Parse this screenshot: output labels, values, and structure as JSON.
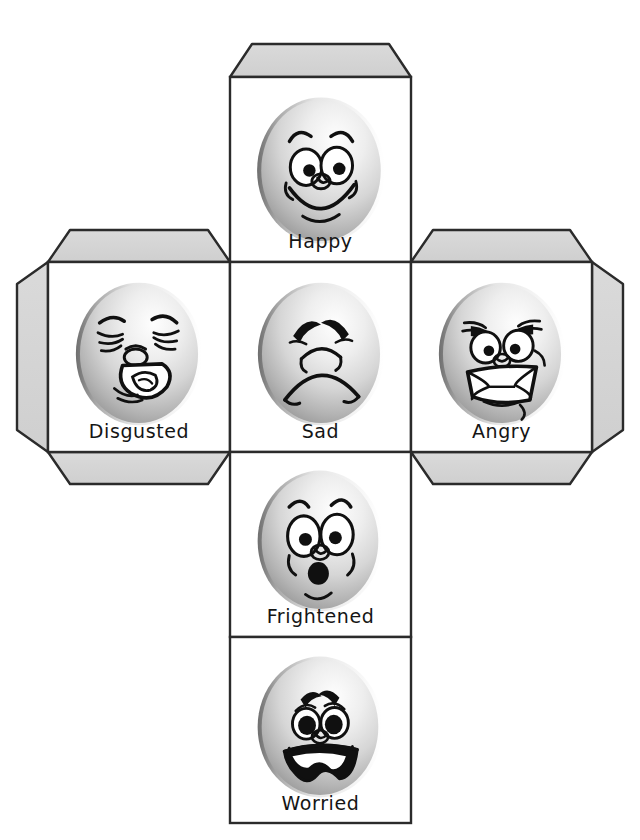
{
  "document": {
    "title": "Emotions Cube Net",
    "description": "Printable foldable cube net (cross layout) with six cartoon emotion faces",
    "page_width": 640,
    "page_height": 840,
    "background_color": "#ffffff"
  },
  "style": {
    "flap_fill": "#d4d4d4",
    "flap_stroke": "#2b2b2b",
    "panel_fill": "#ffffff",
    "panel_stroke": "#2b2b2b",
    "label_color": "#151515",
    "ball_light": "#fdfdfd",
    "ball_mid": "#d2d2d2",
    "ball_dark": "#8e8e8e",
    "ink": "#101010"
  },
  "geometry": {
    "cell": 181,
    "col_x": [
      48,
      230,
      411,
      592
    ],
    "row_y": [
      77,
      262,
      452,
      637,
      823
    ],
    "flap_depth": 33,
    "flap_inset": 22
  },
  "net": {
    "layout": "cross",
    "panels": [
      {
        "id": "panel-happy",
        "label": "Happy",
        "face": "happy",
        "grid": {
          "col": 1,
          "row": 0
        },
        "x": 230,
        "y": 77,
        "w": 181,
        "h": 185,
        "flaps": [
          "top"
        ]
      },
      {
        "id": "panel-disgusted",
        "label": "Disgusted",
        "face": "disgusted",
        "grid": {
          "col": 0,
          "row": 1
        },
        "x": 48,
        "y": 262,
        "w": 182,
        "h": 190,
        "flaps": [
          "left",
          "top",
          "bottom"
        ]
      },
      {
        "id": "panel-sad",
        "label": "Sad",
        "face": "sad",
        "grid": {
          "col": 1,
          "row": 1
        },
        "x": 230,
        "y": 262,
        "w": 181,
        "h": 190,
        "flaps": []
      },
      {
        "id": "panel-angry",
        "label": "Angry",
        "face": "angry",
        "grid": {
          "col": 2,
          "row": 1
        },
        "x": 411,
        "y": 262,
        "w": 181,
        "h": 190,
        "flaps": [
          "right",
          "top",
          "bottom"
        ]
      },
      {
        "id": "panel-frightened",
        "label": "Frightened",
        "face": "frightened",
        "grid": {
          "col": 1,
          "row": 2
        },
        "x": 230,
        "y": 452,
        "w": 181,
        "h": 185,
        "flaps": []
      },
      {
        "id": "panel-worried",
        "label": "Worried",
        "face": "worried",
        "grid": {
          "col": 1,
          "row": 3
        },
        "x": 230,
        "y": 637,
        "w": 181,
        "h": 186,
        "flaps": []
      }
    ]
  },
  "faces": {
    "happy": {
      "name": "happy-face",
      "expression": "Happy",
      "mouth": "wide open smile",
      "eyes": "two round wide eyes",
      "brows": "two raised arches"
    },
    "disgusted": {
      "name": "disgusted-face",
      "expression": "Disgusted",
      "mouth": "open grimace with tongue",
      "eyes": "squeezed shut",
      "brows": "angled inward"
    },
    "sad": {
      "name": "sad-face",
      "expression": "Sad",
      "mouth": "deep downturned frown",
      "eyes": "closed drooping lids",
      "brows": "inner ends raised"
    },
    "angry": {
      "name": "angry-face",
      "expression": "Angry",
      "mouth": "gritted bared teeth",
      "eyes": "narrowed glaring eyes",
      "brows": "sharp V furrow"
    },
    "frightened": {
      "name": "frightened-face",
      "expression": "Frightened",
      "mouth": "small round O",
      "eyes": "two wide staring eyes",
      "brows": "high short arches"
    },
    "worried": {
      "name": "worried-face",
      "expression": "Worried",
      "mouth": "wide wavy open frown",
      "eyes": "two dark anxious eyes",
      "brows": "pinched together"
    }
  }
}
